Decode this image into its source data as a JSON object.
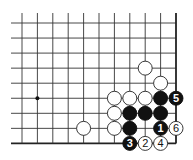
{
  "diagram": {
    "type": "go-board-fragment",
    "columns": 11,
    "rows": 9,
    "edges": {
      "right": true,
      "bottom": true,
      "top": false,
      "left": false
    },
    "colors": {
      "line": "#333333",
      "black_stone": "#111111",
      "white_stone": "#ffffff"
    },
    "hoshi": [
      {
        "col": 1,
        "row": 5
      }
    ],
    "stones": [
      {
        "color": "white",
        "col": 8,
        "row": 3,
        "label": ""
      },
      {
        "color": "white",
        "col": 9,
        "row": 4,
        "label": ""
      },
      {
        "color": "white",
        "col": 6,
        "row": 5,
        "label": ""
      },
      {
        "color": "white",
        "col": 7,
        "row": 5,
        "label": ""
      },
      {
        "color": "white",
        "col": 8,
        "row": 5,
        "label": ""
      },
      {
        "color": "black",
        "col": 9,
        "row": 5,
        "label": ""
      },
      {
        "color": "black",
        "col": 10,
        "row": 5,
        "label": "5"
      },
      {
        "color": "white",
        "col": 6,
        "row": 6,
        "label": ""
      },
      {
        "color": "black",
        "col": 7,
        "row": 6,
        "label": ""
      },
      {
        "color": "black",
        "col": 8,
        "row": 6,
        "label": ""
      },
      {
        "color": "black",
        "col": 9,
        "row": 6,
        "label": ""
      },
      {
        "color": "white",
        "col": 4,
        "row": 7,
        "label": ""
      },
      {
        "color": "white",
        "col": 6,
        "row": 7,
        "label": ""
      },
      {
        "color": "black",
        "col": 7,
        "row": 7,
        "label": ""
      },
      {
        "color": "black",
        "col": 9,
        "row": 7,
        "label": "1"
      },
      {
        "color": "white",
        "col": 10,
        "row": 7,
        "label": "6"
      },
      {
        "color": "black",
        "col": 7,
        "row": 8,
        "label": "3"
      },
      {
        "color": "white",
        "col": 8,
        "row": 8,
        "label": "2"
      },
      {
        "color": "white",
        "col": 9,
        "row": 8,
        "label": "4"
      }
    ],
    "move_sequence": [
      {
        "number": "1",
        "color": "black",
        "col": 9,
        "row": 7
      },
      {
        "number": "2",
        "color": "white",
        "col": 8,
        "row": 8
      },
      {
        "number": "3",
        "color": "black",
        "col": 7,
        "row": 8
      },
      {
        "number": "4",
        "color": "white",
        "col": 9,
        "row": 8
      },
      {
        "number": "5",
        "color": "black",
        "col": 10,
        "row": 5
      },
      {
        "number": "6",
        "color": "white",
        "col": 10,
        "row": 7
      }
    ]
  }
}
